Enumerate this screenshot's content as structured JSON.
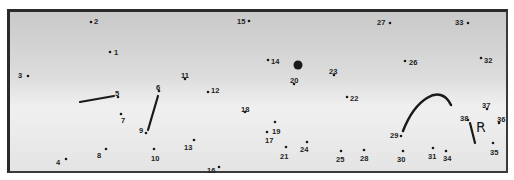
{
  "puzzle": {
    "type": "connect-the-dots",
    "colors": {
      "ink": "#1a1a1a",
      "frame": "#2a2a2a",
      "bg_top": "#c9c9c9",
      "bg_bottom": "#e4e4e4"
    },
    "dots": [
      {
        "n": "1",
        "x": 110,
        "y": 52,
        "lx": 114,
        "ly": 52
      },
      {
        "n": "2",
        "x": 91,
        "y": 22,
        "lx": 94,
        "ly": 21
      },
      {
        "n": "3",
        "x": 28,
        "y": 76,
        "lx": 18,
        "ly": 75
      },
      {
        "n": "4",
        "x": 66,
        "y": 159,
        "lx": 56,
        "ly": 162
      },
      {
        "n": "5",
        "x": 118,
        "y": 97,
        "lx": 115,
        "ly": 93
      },
      {
        "n": "6",
        "x": 159,
        "y": 91,
        "lx": 156,
        "ly": 87
      },
      {
        "n": "7",
        "x": 121,
        "y": 114,
        "lx": 121,
        "ly": 120
      },
      {
        "n": "8",
        "x": 106,
        "y": 149,
        "lx": 97,
        "ly": 155
      },
      {
        "n": "9",
        "x": 146,
        "y": 133,
        "lx": 139,
        "ly": 130
      },
      {
        "n": "10",
        "x": 154,
        "y": 149,
        "lx": 151,
        "ly": 158
      },
      {
        "n": "11",
        "x": 185,
        "y": 79,
        "lx": 181,
        "ly": 75
      },
      {
        "n": "12",
        "x": 208,
        "y": 92,
        "lx": 211,
        "ly": 90
      },
      {
        "n": "13",
        "x": 194,
        "y": 140,
        "lx": 184,
        "ly": 147
      },
      {
        "n": "14",
        "x": 268,
        "y": 60,
        "lx": 271,
        "ly": 61
      },
      {
        "n": "15",
        "x": 249,
        "y": 21,
        "lx": 237,
        "ly": 21
      },
      {
        "n": "16",
        "x": 219,
        "y": 167,
        "lx": 207,
        "ly": 170
      },
      {
        "n": "17",
        "x": 267,
        "y": 132,
        "lx": 265,
        "ly": 140
      },
      {
        "n": "18",
        "x": 245,
        "y": 112,
        "lx": 241,
        "ly": 109
      },
      {
        "n": "19",
        "x": 275,
        "y": 122,
        "lx": 272,
        "ly": 131
      },
      {
        "n": "20",
        "x": 294,
        "y": 84,
        "lx": 290,
        "ly": 80
      },
      {
        "n": "21",
        "x": 286,
        "y": 147,
        "lx": 280,
        "ly": 156
      },
      {
        "n": "22",
        "x": 347,
        "y": 97,
        "lx": 350,
        "ly": 98
      },
      {
        "n": "23",
        "x": 334,
        "y": 75,
        "lx": 329,
        "ly": 71
      },
      {
        "n": "24",
        "x": 307,
        "y": 142,
        "lx": 300,
        "ly": 149
      },
      {
        "n": "25",
        "x": 341,
        "y": 151,
        "lx": 336,
        "ly": 159
      },
      {
        "n": "26",
        "x": 405,
        "y": 61,
        "lx": 409,
        "ly": 62
      },
      {
        "n": "27",
        "x": 390,
        "y": 23,
        "lx": 377,
        "ly": 22
      },
      {
        "n": "28",
        "x": 364,
        "y": 150,
        "lx": 360,
        "ly": 158
      },
      {
        "n": "29",
        "x": 401,
        "y": 136,
        "lx": 390,
        "ly": 135
      },
      {
        "n": "30",
        "x": 403,
        "y": 151,
        "lx": 397,
        "ly": 159
      },
      {
        "n": "31",
        "x": 433,
        "y": 148,
        "lx": 428,
        "ly": 156
      },
      {
        "n": "32",
        "x": 481,
        "y": 58,
        "lx": 484,
        "ly": 60
      },
      {
        "n": "33",
        "x": 468,
        "y": 23,
        "lx": 455,
        "ly": 22
      },
      {
        "n": "34",
        "x": 446,
        "y": 151,
        "lx": 443,
        "ly": 158
      },
      {
        "n": "35",
        "x": 493,
        "y": 143,
        "lx": 490,
        "ly": 152
      },
      {
        "n": "36",
        "x": 499,
        "y": 123,
        "lx": 497,
        "ly": 119
      },
      {
        "n": "37",
        "x": 487,
        "y": 109,
        "lx": 482,
        "ly": 105
      },
      {
        "n": "38",
        "x": 468,
        "y": 120,
        "lx": 460,
        "ly": 118
      }
    ],
    "big_dot": {
      "x": 298,
      "y": 65,
      "r": 4.5
    },
    "strokes": [
      {
        "x1": 80,
        "y1": 102,
        "x2": 114,
        "y2": 96
      },
      {
        "x1": 158,
        "y1": 96,
        "x2": 148,
        "y2": 130
      },
      {
        "x1": 470,
        "y1": 123,
        "x2": 475,
        "y2": 143
      }
    ],
    "arc": "M 403 131 C 415 100, 440 82, 451 105",
    "glyph": {
      "text": "R",
      "x": 476,
      "y": 132
    }
  }
}
